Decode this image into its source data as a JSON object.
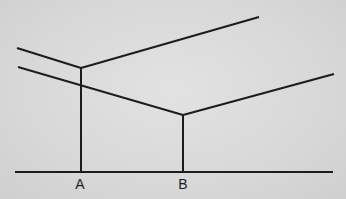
{
  "diagram": {
    "type": "line-geometry",
    "labels": {
      "point_a": "A",
      "point_b": "B"
    },
    "stroke_color": "#1c1c1c",
    "background_color": "#d9d9d9"
  }
}
